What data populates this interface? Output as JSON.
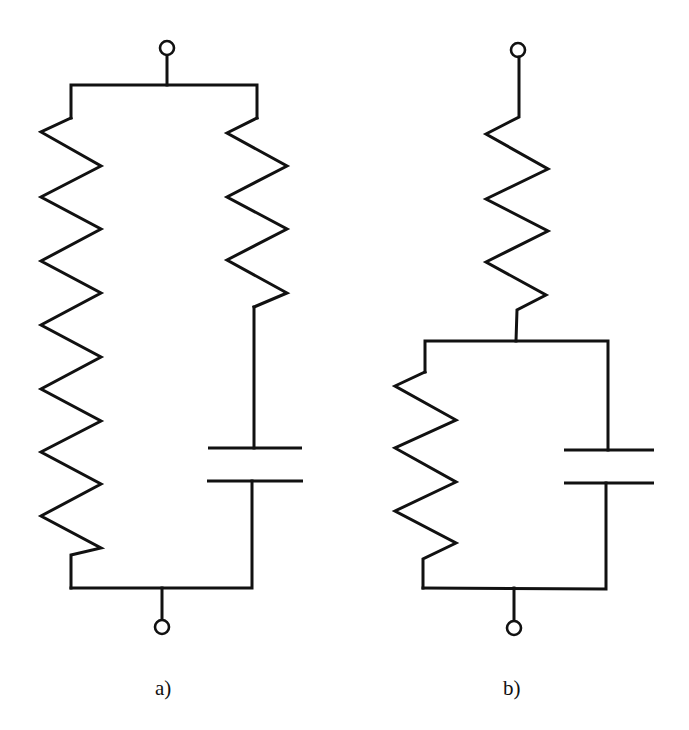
{
  "figure": {
    "type": "circuit-schematic",
    "stroke_color": "#111111",
    "background_color": "#ffffff",
    "circuits": [
      {
        "id": "a",
        "label": "a)",
        "topology": "parallel",
        "components": [
          {
            "type": "resistor",
            "name": "R1",
            "branch": "left",
            "zigzag_peaks": 9
          },
          {
            "type": "resistor",
            "name": "R2",
            "branch": "right",
            "zigzag_peaks": 4,
            "in_series_with": "C1"
          },
          {
            "type": "capacitor",
            "name": "C1",
            "branch": "right"
          }
        ],
        "terminals": [
          "top",
          "bottom"
        ]
      },
      {
        "id": "b",
        "label": "b)",
        "topology": "series resistor + (resistor parallel capacitor)",
        "components": [
          {
            "type": "resistor",
            "name": "R1",
            "position": "top-series",
            "zigzag_peaks": 4
          },
          {
            "type": "resistor",
            "name": "R2",
            "branch": "left",
            "zigzag_peaks": 4
          },
          {
            "type": "capacitor",
            "name": "C1",
            "branch": "right"
          }
        ],
        "terminals": [
          "top",
          "bottom"
        ]
      }
    ]
  }
}
